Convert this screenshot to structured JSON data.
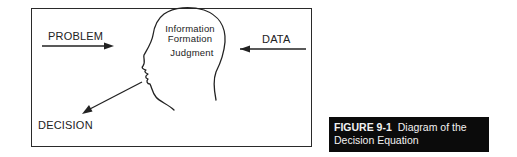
{
  "diagram": {
    "labels": {
      "problem": "PROBLEM",
      "data": "DATA",
      "decision": "DECISION",
      "head_line1": "Information",
      "head_line2": "Formation",
      "head_line3": "Judgment"
    },
    "colors": {
      "stroke": "#222222",
      "caption_bg": "#0b0b0b",
      "caption_text": "#f2f2f2"
    }
  },
  "caption": {
    "figure_number": "FIGURE 9-1",
    "title_line1": "Diagram of the",
    "title_line2": "Decision Equation"
  }
}
